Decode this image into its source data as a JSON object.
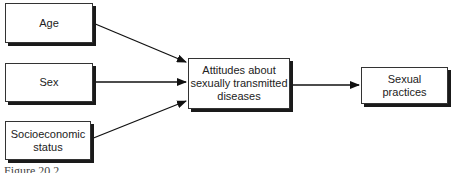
{
  "diagram": {
    "nodes": {
      "age": "Age",
      "sex": "Sex",
      "ses_line1": "Socioeconomic",
      "ses_line2": "status",
      "attitudes_line1": "Attitudes about",
      "attitudes_line2": "sexually transmitted",
      "attitudes_line3": "diseases",
      "practices_line1": "Sexual",
      "practices_line2": "practices"
    },
    "edges": [
      {
        "from": "Age",
        "to": "Attitudes about sexually transmitted diseases"
      },
      {
        "from": "Sex",
        "to": "Attitudes about sexually transmitted diseases"
      },
      {
        "from": "Socioeconomic status",
        "to": "Attitudes about sexually transmitted diseases"
      },
      {
        "from": "Attitudes about sexually transmitted diseases",
        "to": "Sexual practices"
      }
    ],
    "caption": "Figure 20.2"
  }
}
